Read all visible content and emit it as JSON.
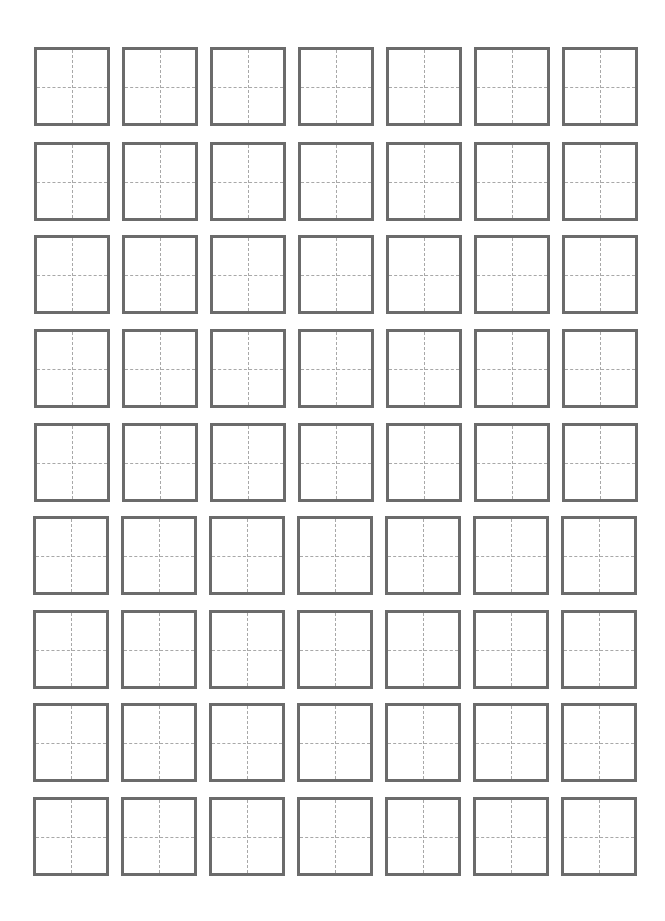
{
  "sheet": {
    "type": "tianzige-practice-grid",
    "rows": 9,
    "columns": 7,
    "cell_style": "square with dashed center cross guides",
    "colors": {
      "background": "#ffffff",
      "cell_border": "#6b6b6b",
      "guide_lines": "#a8a8a8"
    },
    "column_x": [
      34,
      122,
      210,
      298,
      386,
      474,
      562
    ],
    "row_y": [
      47,
      142,
      235,
      329,
      423,
      516,
      610,
      703,
      797
    ],
    "cell_width": 76,
    "cell_height": 79
  }
}
